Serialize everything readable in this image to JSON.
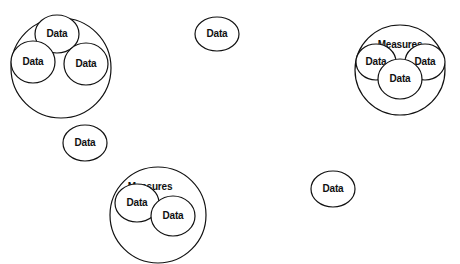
{
  "diagram": {
    "type": "nested-circles",
    "groups": [
      {
        "id": "group-top-left",
        "outer": {
          "cx": 61,
          "cy": 68,
          "r": 50,
          "label": ""
        },
        "items": [
          {
            "cx": 57,
            "cy": 34,
            "rx": 22,
            "ry": 19,
            "label": "Data"
          },
          {
            "cx": 33,
            "cy": 62,
            "rx": 22,
            "ry": 21,
            "label": "Data"
          },
          {
            "cx": 86,
            "cy": 64,
            "rx": 22,
            "ry": 21,
            "label": "Data"
          }
        ]
      },
      {
        "id": "group-top-right",
        "outer": {
          "cx": 400,
          "cy": 70,
          "r": 45,
          "label": "Measures"
        },
        "items": [
          {
            "cx": 376,
            "cy": 62,
            "rx": 20,
            "ry": 18,
            "label": "Data"
          },
          {
            "cx": 425,
            "cy": 62,
            "rx": 20,
            "ry": 18,
            "label": "Data"
          },
          {
            "cx": 400,
            "cy": 79,
            "rx": 22,
            "ry": 20,
            "label": "Data"
          }
        ]
      },
      {
        "id": "group-bottom",
        "outer": {
          "cx": 158,
          "cy": 215,
          "r": 48,
          "label": "Measures"
        },
        "items": [
          {
            "cx": 137,
            "cy": 203,
            "rx": 22,
            "ry": 19,
            "label": "Data"
          },
          {
            "cx": 173,
            "cy": 216,
            "rx": 22,
            "ry": 20,
            "label": "Data"
          }
        ]
      }
    ],
    "standalone": [
      {
        "cx": 217,
        "cy": 34,
        "rx": 22,
        "ry": 17,
        "label": "Data"
      },
      {
        "cx": 85,
        "cy": 143,
        "rx": 22,
        "ry": 18,
        "label": "Data"
      },
      {
        "cx": 333,
        "cy": 189,
        "rx": 22,
        "ry": 18,
        "label": "Data"
      }
    ]
  }
}
